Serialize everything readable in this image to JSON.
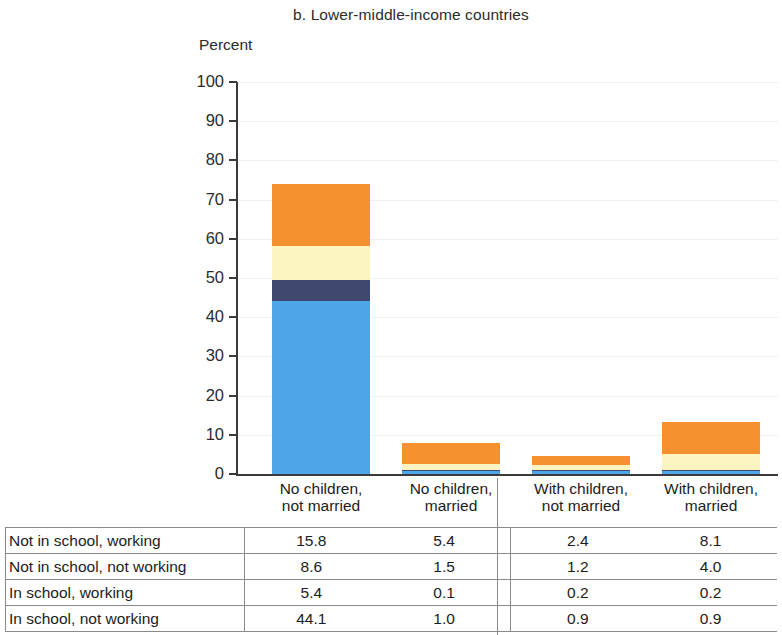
{
  "chart_title": "b. Lower-middle-income countries",
  "y_axis_title": "Percent",
  "y_ticks": [
    "100",
    "90",
    "80",
    "70",
    "60",
    "50",
    "40",
    "30",
    "20",
    "10",
    "0"
  ],
  "categories": [
    {
      "line1": "No children,",
      "line2": "not married"
    },
    {
      "line1": "No children,",
      "line2": "married"
    },
    {
      "line1": "With children,",
      "line2": "not married"
    },
    {
      "line1": "With children,",
      "line2": "married"
    }
  ],
  "table": {
    "rows": [
      {
        "label": "Not in school, working",
        "values": [
          "15.8",
          "5.4",
          "2.4",
          "8.1"
        ]
      },
      {
        "label": "Not in school, not working",
        "values": [
          "8.6",
          "1.5",
          "1.2",
          "4.0"
        ]
      },
      {
        "label": "In school, working",
        "values": [
          "5.4",
          "0.1",
          "0.2",
          "0.2"
        ]
      },
      {
        "label": "In school, not working",
        "values": [
          "44.1",
          "1.0",
          "0.9",
          "0.9"
        ]
      }
    ]
  },
  "colors": {
    "not_in_school_working": "#F5912E",
    "not_in_school_not_working": "#FBF3C0",
    "in_school_working": "#41486E",
    "in_school_not_working": "#4DA6E8",
    "axis": "#3a3a3a",
    "gridline": "#f1f1f1"
  },
  "chart_data": {
    "type": "bar",
    "title": "b. Lower-middle-income countries",
    "xlabel": "",
    "ylabel": "Percent",
    "ylim": [
      0,
      100
    ],
    "ytick_step": 10,
    "grid": true,
    "stacked": true,
    "legend": "none",
    "categories": [
      "No children, not married",
      "No children, married",
      "With children, not married",
      "With children, married"
    ],
    "series": [
      {
        "name": "In school, not working",
        "values": [
          44.1,
          1.0,
          0.9,
          0.9
        ],
        "color": "#4DA6E8",
        "stack_order": 1
      },
      {
        "name": "In school, working",
        "values": [
          5.4,
          0.1,
          0.2,
          0.2
        ],
        "color": "#41486E",
        "stack_order": 2
      },
      {
        "name": "Not in school, not working",
        "values": [
          8.6,
          1.5,
          1.2,
          4.0
        ],
        "color": "#FBF3C0",
        "stack_order": 3
      },
      {
        "name": "Not in school, working",
        "values": [
          15.8,
          5.4,
          2.4,
          8.1
        ],
        "color": "#F5912E",
        "stack_order": 4
      }
    ],
    "totals": [
      73.9,
      8.0,
      4.7,
      13.2
    ]
  }
}
